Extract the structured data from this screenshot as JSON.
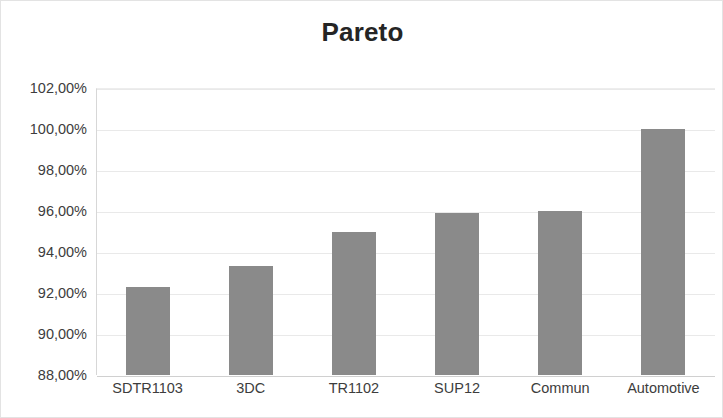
{
  "chart_data": {
    "type": "bar",
    "title": "Pareto",
    "xlabel": "",
    "ylabel": "",
    "categories": [
      "SDTR1103",
      "3DC",
      "TR1102",
      "SUP12",
      "Commun",
      "Automotive"
    ],
    "values": [
      92.3,
      93.3,
      95.0,
      95.9,
      96.0,
      100.0
    ],
    "value_labels": [
      "92,30%",
      "93,30%",
      "95,00%",
      "95,90%",
      "96,00%",
      "100,00%"
    ],
    "ylim": [
      88.0,
      102.0
    ],
    "ytick_values": [
      102.0,
      100.0,
      98.0,
      96.0,
      94.0,
      92.0,
      90.0,
      88.0
    ],
    "ytick_labels": [
      "102,00%",
      "100,00%",
      "98,00%",
      "96,00%",
      "94,00%",
      "92,00%",
      "90,00%",
      "88,00%"
    ],
    "grid": true,
    "legend": false,
    "legend_position": "none",
    "series_color": "#8a8a8a",
    "gridline_color": "#e9e9e9",
    "axis_color": "#d0d0d0",
    "text_color": "#3d3d3d",
    "title_color": "#252525",
    "background": "#ffffff"
  }
}
